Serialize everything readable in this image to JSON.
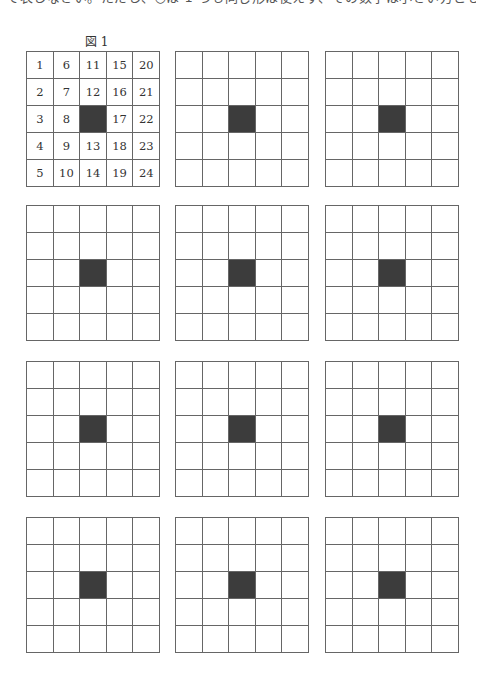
{
  "top_text": "て表しなさい。ただし、○は 1 つも同じ形は使えず、その数字は小さい方とします。",
  "figure": {
    "label": "図 1",
    "numbers": [
      [
        "1",
        "6",
        "11",
        "15",
        "20"
      ],
      [
        "2",
        "7",
        "12",
        "16",
        "21"
      ],
      [
        "3",
        "8",
        "",
        "17",
        "22"
      ],
      [
        "4",
        "9",
        "13",
        "18",
        "23"
      ],
      [
        "5",
        "10",
        "14",
        "19",
        "24"
      ]
    ],
    "filled_cell": {
      "row": 2,
      "col": 2
    }
  },
  "answer_grids": {
    "count": 11,
    "rows": 5,
    "cols": 5,
    "filled_cell": {
      "row": 2,
      "col": 2
    }
  },
  "colors": {
    "line": "#666666",
    "filled": "#3c3c3c",
    "background": "#ffffff"
  }
}
